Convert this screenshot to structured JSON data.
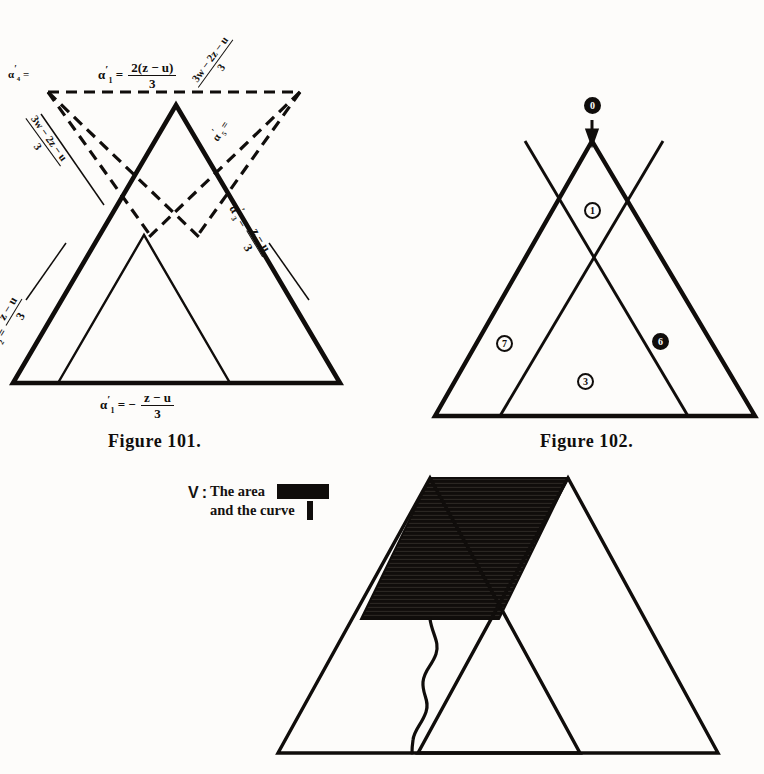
{
  "page": {
    "background": "#fdfcfa",
    "ink": "#100d0b",
    "width": 764,
    "height": 774
  },
  "figure101": {
    "caption": "Figure 101.",
    "labels": {
      "top": {
        "sym": "α",
        "sub": "1",
        "prime": "′",
        "eq": "=",
        "sign": "",
        "num": "2(z − u)",
        "den": "3"
      },
      "bottom": {
        "sym": "α",
        "sub": "1",
        "prime": "′",
        "eq": "=",
        "sign": "−",
        "num": "z − u",
        "den": "3"
      },
      "left_lower": {
        "sym": "α",
        "sub": "2",
        "prime": "′",
        "eq": "=",
        "sign": "",
        "num": "z − u",
        "den": "3"
      },
      "right_lower": {
        "sym": "α",
        "sub": "3",
        "prime": "′",
        "eq": "=",
        "sign": "",
        "num": "z − u",
        "den": "3"
      },
      "left_upper": {
        "sym": "α",
        "sub": "4",
        "prime": "′",
        "eq": "=",
        "sign": "",
        "num": "3w − 2z − u",
        "den": "3"
      },
      "right_upper": {
        "sym": "α",
        "sub": "5",
        "prime": "′",
        "eq": "=",
        "sign": "",
        "num": "3w − 2z − u",
        "den": "3"
      }
    },
    "geometry": {
      "outer_triangle": "13,383 340,383 176,105",
      "inner_triangle": "58,383 230,383 144,235",
      "dashed_trapezoid": "48,92 300,92 230,235 114,235"
    }
  },
  "figure102": {
    "caption": "Figure 102.",
    "regions": [
      {
        "id": "0",
        "label": "0",
        "name": "entry-marker",
        "filled": true
      },
      {
        "id": "1",
        "label": "1",
        "name": "region-one",
        "filled": false
      },
      {
        "id": "7",
        "label": "7",
        "name": "region-seven",
        "filled": false
      },
      {
        "id": "3",
        "label": "3",
        "name": "region-three",
        "filled": false
      },
      {
        "id": "6",
        "label": "6",
        "name": "region-six",
        "filled": true
      }
    ],
    "geometry": {
      "outer_triangle": "435,416 755,416 592,141",
      "left_slant": "500,416 663,141",
      "right_slant": "688,416 525,141"
    }
  },
  "figure103": {
    "legend": {
      "prefix": "V",
      "colon": ":",
      "line1": "The area",
      "line2": "and the curve",
      "swatch_area_name": "area-swatch",
      "swatch_curve_name": "curve-swatch"
    },
    "geometry": {
      "left_triangle": "278,753 580,753 430,476",
      "right_triangle": "418,753 718,753 568,476",
      "filled_rhombus": "430,476 568,476 498,617 360,617"
    }
  }
}
